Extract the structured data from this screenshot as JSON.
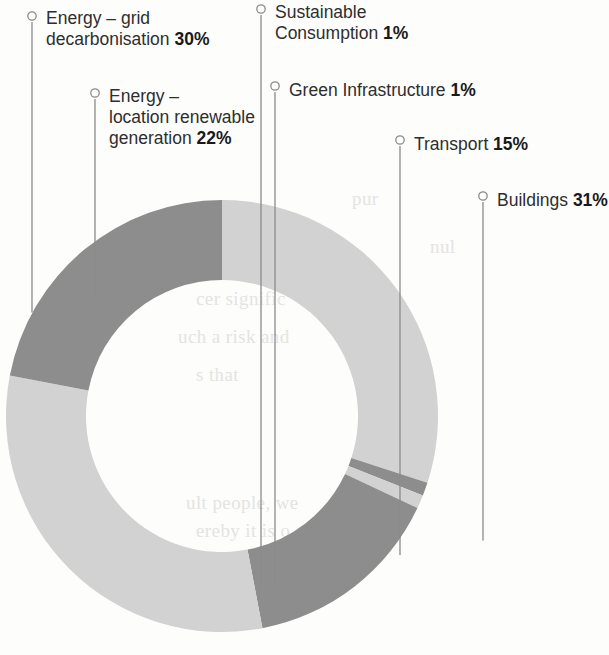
{
  "chart_data": {
    "type": "pie",
    "variant": "donut",
    "title": "",
    "unit": "%",
    "total": 100,
    "start_angle_deg": -90,
    "direction": "clockwise",
    "legend_position": "callout-leader-lines",
    "categories": [
      "Energy – grid decarbonisation",
      "Sustainable Consumption",
      "Green Infrastructure",
      "Transport",
      "Buildings",
      "Energy – location renewable generation"
    ],
    "values": [
      30,
      1,
      1,
      15,
      31,
      22
    ],
    "colors": [
      "#d2d2d2",
      "#8d8d8d",
      "#d2d2d2",
      "#8d8d8d",
      "#d2d2d2",
      "#8d8d8d"
    ],
    "slices": [
      {
        "name": "Energy – grid decarbonisation",
        "value": 30,
        "label": "30%",
        "color": "#d2d2d2"
      },
      {
        "name": "Sustainable Consumption",
        "value": 1,
        "label": "1%",
        "color": "#8d8d8d"
      },
      {
        "name": "Green Infrastructure",
        "value": 1,
        "label": "1%",
        "color": "#d2d2d2"
      },
      {
        "name": "Transport",
        "value": 15,
        "label": "15%",
        "color": "#8d8d8d"
      },
      {
        "name": "Buildings",
        "value": 31,
        "label": "31%",
        "color": "#d2d2d2"
      },
      {
        "name": "Energy – location renewable generation",
        "value": 22,
        "label": "22%",
        "color": "#8d8d8d"
      }
    ]
  },
  "palette": {
    "dark_grey": "#8d8d8d",
    "light_grey": "#d2d2d2",
    "leader_line": "#8b8b8b",
    "text": "#2e2e2e",
    "background": "#fdfdfc"
  },
  "callouts": {
    "energy_grid": {
      "line1": "Energy – grid",
      "line2_text": "decarbonisation ",
      "line2_value": "30%"
    },
    "energy_location": {
      "line1": "Energy –",
      "line2": "location renewable",
      "line3_text": "generation ",
      "line3_value": "22%"
    },
    "sustainable_consumption": {
      "line1": "Sustainable",
      "line2_text": "Consumption ",
      "line2_value": "1%"
    },
    "green_infrastructure": {
      "text": "Green Infrastructure ",
      "value": "1%"
    },
    "transport": {
      "text": "Transport ",
      "value": "15%"
    },
    "buildings": {
      "text": "Buildings ",
      "value": "31%"
    }
  },
  "bleed_through": {
    "l1": "pur",
    "l2": "the",
    "l3": "nul",
    "l4": "cer signific",
    "l5": "uch a risk and",
    "l6": "s that",
    "l7": "ult people, we",
    "l8": "ereby it is o"
  }
}
